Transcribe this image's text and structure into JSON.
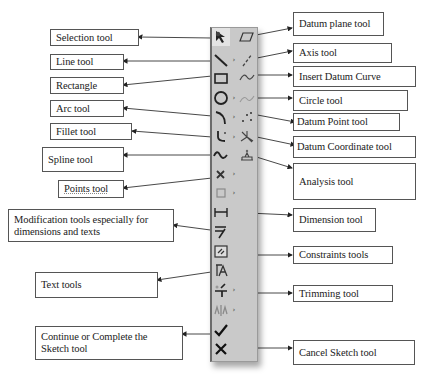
{
  "diagram": {
    "title": "",
    "toolbar": {
      "background": "#c9c9c9",
      "left_column": [
        {
          "id": "selection",
          "icon": "arrow-pointer-icon",
          "has_flyout": false
        },
        {
          "id": "line",
          "icon": "line-icon",
          "has_flyout": true
        },
        {
          "id": "rectangle",
          "icon": "rectangle-icon",
          "has_flyout": false
        },
        {
          "id": "circle",
          "icon": "circle-icon",
          "has_flyout": true
        },
        {
          "id": "arc",
          "icon": "arc-icon",
          "has_flyout": true
        },
        {
          "id": "fillet",
          "icon": "fillet-icon",
          "has_flyout": true
        },
        {
          "id": "spline",
          "icon": "spline-icon",
          "has_flyout": false
        },
        {
          "id": "points",
          "icon": "point-x-icon",
          "has_flyout": true
        },
        {
          "id": "offset",
          "icon": "offset-square-icon",
          "has_flyout": true
        },
        {
          "id": "dimension",
          "icon": "dimension-icon",
          "has_flyout": false
        },
        {
          "id": "modify",
          "icon": "modify-icon",
          "has_flyout": false
        },
        {
          "id": "constraints",
          "icon": "constraints-icon",
          "has_flyout": false
        },
        {
          "id": "text",
          "icon": "text-icon",
          "has_flyout": false
        },
        {
          "id": "trim",
          "icon": "trim-icon",
          "has_flyout": true
        },
        {
          "id": "mirror",
          "icon": "mirror-icon",
          "has_flyout": true
        },
        {
          "id": "done",
          "icon": "checkmark-icon",
          "has_flyout": false
        },
        {
          "id": "cancel",
          "icon": "x-cancel-icon",
          "has_flyout": false
        }
      ],
      "right_column": [
        {
          "id": "datum-plane",
          "icon": "datum-plane-icon"
        },
        {
          "id": "axis",
          "icon": "axis-icon"
        },
        {
          "id": "datum-curve",
          "icon": "datum-curve-icon"
        },
        {
          "id": "datum-curve-2",
          "icon": "datum-curve-faded-icon"
        },
        {
          "id": "datum-point",
          "icon": "datum-point-icon"
        },
        {
          "id": "datum-csys",
          "icon": "datum-coordinate-icon"
        },
        {
          "id": "analysis",
          "icon": "analysis-icon"
        }
      ]
    },
    "labels_left": {
      "selection": "Selection tool",
      "line": "Line tool",
      "rectangle": "Rectangle",
      "arc": "Arc tool",
      "fillet": "Fillet tool",
      "spline": "Spline tool",
      "points": "Points tool",
      "modification": "Modification tools especially for dimensions and texts",
      "text": "Text tools",
      "continue": "Continue or Complete the Sketch tool"
    },
    "labels_right": {
      "datum_plane": "Datum plane tool",
      "axis": "Axis tool",
      "datum_curve": "Insert Datum Curve",
      "circle": "Circle tool",
      "datum_point": "Datum Point tool",
      "datum_coordinate": "Datum Coordinate tool",
      "analysis": "Analysis tool",
      "dimension": "Dimension tool",
      "constraints": "Constraints tools",
      "trimming": "Trimming tool",
      "cancel": "Cancel Sketch tool"
    }
  }
}
